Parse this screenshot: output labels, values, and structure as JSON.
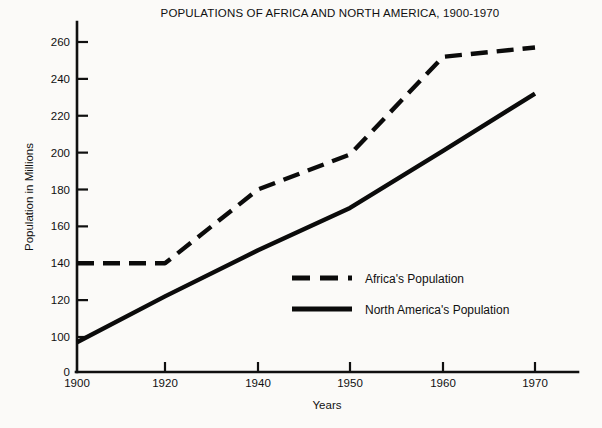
{
  "chart_data": {
    "type": "line",
    "title": "POPULATIONS OF AFRICA AND NORTH AMERICA, 1900-1970",
    "xlabel": "Years",
    "ylabel": "Population in Millions",
    "x": [
      1900,
      1920,
      1940,
      1950,
      1960,
      1970
    ],
    "xtick_labels": [
      "1900",
      "1920",
      "1940",
      "1950",
      "1960",
      "1970"
    ],
    "ytick_labels": [
      "0",
      "100",
      "120",
      "140",
      "160",
      "180",
      "200",
      "220",
      "240",
      "260"
    ],
    "ytick_values": [
      0,
      100,
      120,
      140,
      160,
      180,
      200,
      220,
      240,
      260
    ],
    "ylim": [
      0,
      268
    ],
    "xlim": [
      1900,
      1974
    ],
    "axis_break": "y-axis has a scale break between 0 and 100",
    "grid": false,
    "legend_position": "center-right inside plot area",
    "series": [
      {
        "name": "Africa's Population",
        "style": "dashed",
        "color": "#0b0b0b",
        "values": [
          140,
          140,
          180,
          199,
          252,
          257
        ]
      },
      {
        "name": "North America's Population",
        "style": "solid",
        "color": "#0b0b0b",
        "values": [
          85,
          122,
          147,
          170,
          201,
          232
        ]
      }
    ]
  },
  "legend": {
    "items": [
      {
        "label": "Africa's Population",
        "style": "dashed"
      },
      {
        "label": "North America's Population",
        "style": "solid"
      }
    ]
  }
}
